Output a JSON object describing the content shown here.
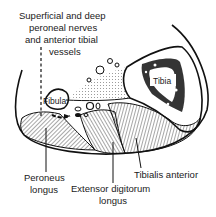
{
  "diagram": {
    "type": "anatomical cross-section",
    "labels": {
      "nerves_line1": "Superficial and deep",
      "nerves_line2": "peroneal nerves",
      "nerves_line3": "and anterior tibial",
      "nerves_line4": "vessels",
      "tibia": "Tibia",
      "fibula": "Fibula",
      "peroneus_line1": "Peroneus",
      "peroneus_line2": "longus",
      "extensor_line1": "Extensor digitorum",
      "extensor_line2": "longus",
      "tibialis": "Tibialis anterior"
    },
    "colors": {
      "ink": "#111111",
      "background": "#ffffff"
    }
  }
}
